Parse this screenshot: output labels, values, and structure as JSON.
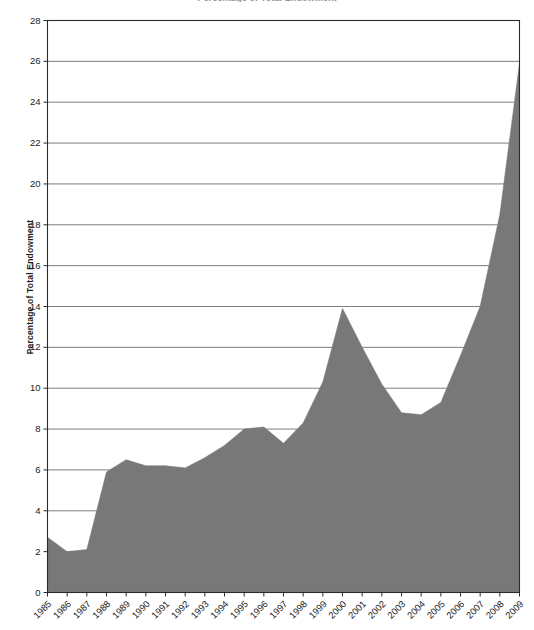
{
  "chart_data": {
    "type": "area",
    "title": "Percentage of Total Endowment",
    "subtitle": "",
    "xlabel": "",
    "ylabel": "Percentage of Total Endowment",
    "categories": [
      "1985",
      "1986",
      "1987",
      "1988",
      "1989",
      "1990",
      "1991",
      "1992",
      "1993",
      "1994",
      "1995",
      "1996",
      "1997",
      "1998",
      "1999",
      "2000",
      "2001",
      "2002",
      "2003",
      "2004",
      "2005",
      "2006",
      "2007",
      "2008",
      "2009"
    ],
    "values": [
      2.7,
      2.0,
      2.1,
      5.9,
      6.5,
      6.2,
      6.2,
      6.1,
      6.6,
      7.2,
      8.0,
      8.1,
      7.3,
      8.3,
      10.3,
      13.9,
      12.0,
      10.2,
      8.8,
      8.7,
      9.3,
      11.6,
      14.0,
      18.5,
      25.9
    ],
    "ylim": [
      0,
      28
    ],
    "ytick_step": 2,
    "yticks": [
      "0",
      "2",
      "4",
      "6",
      "8",
      "10",
      "12",
      "14",
      "16",
      "18",
      "20",
      "22",
      "24",
      "26",
      "28"
    ],
    "grid": "horizontal",
    "legend": "none",
    "series": [
      {
        "name": "Percentage of Total Endowment",
        "values": [
          2.7,
          2.0,
          2.1,
          5.9,
          6.5,
          6.2,
          6.2,
          6.1,
          6.6,
          7.2,
          8.0,
          8.1,
          7.3,
          8.3,
          10.3,
          13.9,
          12.0,
          10.2,
          8.8,
          8.7,
          9.3,
          11.6,
          14.0,
          18.5,
          25.9
        ]
      }
    ],
    "colors": {
      "area_fill": "#787878",
      "axis": "#2b2b2b",
      "gridline": "#6f6f6f",
      "text": "#1b1b1b",
      "background": "#ffffff"
    }
  }
}
